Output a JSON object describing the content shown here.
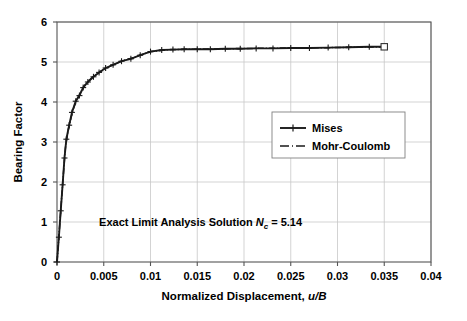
{
  "chart_data": {
    "type": "line",
    "title": "",
    "xlabel": "Normalized Displacement, u/B",
    "xlabel_plain": "Normalized Displacement, ",
    "xlabel_italic": "u/B",
    "ylabel": "Bearing Factor",
    "xlim": [
      0,
      0.04
    ],
    "ylim": [
      0,
      6
    ],
    "grid": true,
    "xticks": [
      0,
      0.005,
      0.01,
      0.015,
      0.02,
      0.025,
      0.03,
      0.035,
      0.04
    ],
    "xtick_labels": [
      "0",
      "0.005",
      "0.01",
      "0.015",
      "0.02",
      "0.025",
      "0.03",
      "0.035",
      "0.04"
    ],
    "yticks": [
      0,
      1,
      2,
      3,
      4,
      5,
      6
    ],
    "ytick_labels": [
      "0",
      "1",
      "2",
      "3",
      "4",
      "5",
      "6"
    ],
    "legend_position": "center-right",
    "annotations": [
      {
        "text": "Exact Limit Analysis Solution Nc = 5.14",
        "prefix": "Exact Limit Analysis Solution ",
        "symbol": "N",
        "subscript": "c",
        "suffix": " = 5.14",
        "value": 5.14,
        "x": 0.0045,
        "y": 0.9
      }
    ],
    "series": [
      {
        "name": "Mises",
        "marker": "plus",
        "linestyle": "dash-dot",
        "color": "#1a1a1a",
        "points": [
          [
            0.0,
            0.0
          ],
          [
            0.0002,
            0.62
          ],
          [
            0.0004,
            1.28
          ],
          [
            0.0006,
            1.93
          ],
          [
            0.0008,
            2.6
          ],
          [
            0.001,
            3.07
          ],
          [
            0.0013,
            3.42
          ],
          [
            0.0016,
            3.74
          ],
          [
            0.002,
            4.02
          ],
          [
            0.0024,
            4.16
          ],
          [
            0.0028,
            4.36
          ],
          [
            0.0033,
            4.5
          ],
          [
            0.0039,
            4.63
          ],
          [
            0.0045,
            4.74
          ],
          [
            0.0052,
            4.85
          ],
          [
            0.006,
            4.93
          ],
          [
            0.0069,
            5.02
          ],
          [
            0.0079,
            5.08
          ],
          [
            0.0089,
            5.17
          ],
          [
            0.01,
            5.26
          ],
          [
            0.0112,
            5.3
          ],
          [
            0.0124,
            5.31
          ],
          [
            0.0136,
            5.32
          ],
          [
            0.015,
            5.32
          ],
          [
            0.0164,
            5.32
          ],
          [
            0.018,
            5.33
          ],
          [
            0.0196,
            5.33
          ],
          [
            0.0213,
            5.34
          ],
          [
            0.0231,
            5.34
          ],
          [
            0.025,
            5.35
          ],
          [
            0.027,
            5.35
          ],
          [
            0.029,
            5.36
          ],
          [
            0.0312,
            5.37
          ],
          [
            0.0334,
            5.38
          ],
          [
            0.035,
            5.38
          ]
        ]
      },
      {
        "name": "Mohr-Coulomb",
        "marker": "square-open-end",
        "linestyle": "dash-dot",
        "color": "#1a1a1a",
        "points": [
          [
            0.0,
            0.0
          ],
          [
            0.0003,
            0.95
          ],
          [
            0.0006,
            1.95
          ],
          [
            0.0009,
            2.85
          ],
          [
            0.0012,
            3.3
          ],
          [
            0.0017,
            3.8
          ],
          [
            0.0022,
            4.1
          ],
          [
            0.0029,
            4.4
          ],
          [
            0.0037,
            4.6
          ],
          [
            0.0047,
            4.77
          ],
          [
            0.0058,
            4.91
          ],
          [
            0.007,
            5.03
          ],
          [
            0.0084,
            5.13
          ],
          [
            0.01,
            5.26
          ],
          [
            0.012,
            5.31
          ],
          [
            0.0145,
            5.32
          ],
          [
            0.0175,
            5.33
          ],
          [
            0.021,
            5.34
          ],
          [
            0.025,
            5.35
          ],
          [
            0.0295,
            5.36
          ],
          [
            0.035,
            5.38
          ]
        ]
      }
    ],
    "end_marker": {
      "shape": "square-open",
      "x": 0.035,
      "y": 5.38
    }
  }
}
